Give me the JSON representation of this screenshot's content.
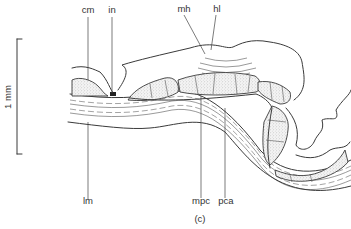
{
  "figure": {
    "panel_label": "(c)",
    "scale_bar": {
      "label": "1 mm"
    },
    "labels": [
      {
        "id": "cm",
        "text": "cm"
      },
      {
        "id": "in",
        "text": "in"
      },
      {
        "id": "mh",
        "text": "mh"
      },
      {
        "id": "hl",
        "text": "hl"
      },
      {
        "id": "lm",
        "text": "lm"
      },
      {
        "id": "mpc",
        "text": "mpc"
      },
      {
        "id": "pca",
        "text": "pca"
      }
    ]
  },
  "colors": {
    "ink": "#3a3a3a",
    "background": "#ffffff"
  }
}
